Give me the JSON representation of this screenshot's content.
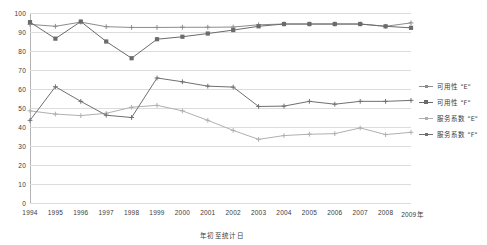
{
  "chart_data": {
    "type": "line",
    "title": "",
    "xlabel": "年",
    "ylabel": "",
    "ylim": [
      0,
      100
    ],
    "grid": true,
    "legend_position": "right",
    "caption": "年初至统计日",
    "x_axis_suffix": "年",
    "categories": [
      "1994",
      "1995",
      "1996",
      "1997",
      "1998",
      "1999",
      "2000",
      "2001",
      "2002",
      "2003",
      "2004",
      "2005",
      "2006",
      "2007",
      "2008",
      "2009"
    ],
    "yticks": [
      0,
      10,
      20,
      30,
      40,
      50,
      60,
      70,
      80,
      90,
      100
    ],
    "series": [
      {
        "name": "可用性 \"E\"",
        "color": "#8c8c8c",
        "marker": "plus",
        "values": [
          94.0,
          93.0,
          95.2,
          92.8,
          92.4,
          92.4,
          92.5,
          92.5,
          92.6,
          93.8,
          94.2,
          94.2,
          94.2,
          94.2,
          93.0,
          94.8
        ]
      },
      {
        "name": "可用性 \"F\"",
        "color": "#6b6b6b",
        "marker": "square",
        "values": [
          95.2,
          86.5,
          95.5,
          85.0,
          76.2,
          86.2,
          87.5,
          89.2,
          91.0,
          93.0,
          94.2,
          94.2,
          94.2,
          94.2,
          93.0,
          92.2
        ]
      },
      {
        "name": "服务系数 \"E\"",
        "color": "#b0b0b0",
        "marker": "plus",
        "values": [
          48.5,
          46.8,
          46.0,
          47.2,
          50.4,
          51.4,
          48.5,
          43.5,
          38.2,
          33.5,
          35.5,
          36.2,
          36.5,
          39.5,
          36.0,
          37.2
        ]
      },
      {
        "name": "服务系数 \"F\"",
        "color": "#707070",
        "marker": "plus",
        "values": [
          43.5,
          61.2,
          53.5,
          46.2,
          45.0,
          65.8,
          63.8,
          61.5,
          61.0,
          50.8,
          51.0,
          53.5,
          52.0,
          53.5,
          53.5,
          54.0
        ]
      }
    ]
  },
  "legend": {
    "items": [
      {
        "label": "可用性 \"E\"",
        "color": "#8c8c8c",
        "marker": "plus"
      },
      {
        "label": "可用性 \"F\"",
        "color": "#6b6b6b",
        "marker": "square"
      },
      {
        "label": "服务系数 \"E\"",
        "color": "#b0b0b0",
        "marker": "plus"
      },
      {
        "label": "服务系数 \"F\"",
        "color": "#707070",
        "marker": "plus"
      }
    ]
  }
}
